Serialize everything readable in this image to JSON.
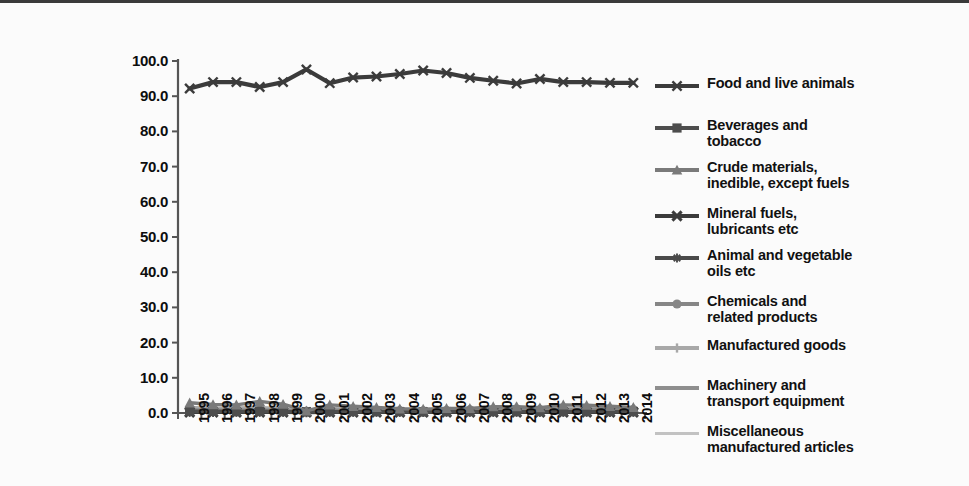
{
  "figure": {
    "background_color": "#fbfbfb",
    "border_top_color": "#3a3a3a"
  },
  "chart_data": {
    "type": "line",
    "title": "",
    "subtitle": "",
    "xlabel": "",
    "ylabel": "",
    "grid": false,
    "legend_position": "right",
    "ylim": [
      0.0,
      100.0
    ],
    "ytick_labels": [
      "100.0",
      "90.0",
      "80.0",
      "70.0",
      "60.0",
      "50.0",
      "40.0",
      "30.0",
      "20.0",
      "10.0",
      "0.0"
    ],
    "ytick_values": [
      100.0,
      90.0,
      80.0,
      70.0,
      60.0,
      50.0,
      40.0,
      30.0,
      20.0,
      10.0,
      0.0
    ],
    "categories": [
      "1995",
      "1996",
      "1997",
      "1998",
      "1999",
      "2000",
      "2001",
      "2002",
      "2003",
      "2004",
      "2005",
      "2006",
      "2007",
      "2008",
      "2009",
      "2010",
      "2011",
      "2012",
      "2013",
      "2014"
    ],
    "x": [
      1995,
      1996,
      1997,
      1998,
      1999,
      2000,
      2001,
      2002,
      2003,
      2004,
      2005,
      2006,
      2007,
      2008,
      2009,
      2010,
      2011,
      2012,
      2013,
      2014
    ],
    "series": [
      {
        "name": "Food and live animals",
        "color": "#3b3b3b",
        "marker": "x",
        "values": [
          92.2,
          94.0,
          94.0,
          92.6,
          94.0,
          97.6,
          93.7,
          95.3,
          95.6,
          96.3,
          97.3,
          96.6,
          95.2,
          94.4,
          93.6,
          94.9,
          94.0,
          94.0,
          93.8,
          93.8
        ]
      },
      {
        "name": "Beverages and\ntobacco",
        "color": "#4d4d4d",
        "marker": "square",
        "values": [
          0.5,
          0.5,
          0.4,
          0.5,
          0.4,
          0.3,
          0.4,
          0.4,
          0.4,
          0.4,
          0.3,
          0.4,
          0.4,
          0.4,
          0.4,
          0.4,
          0.4,
          0.4,
          0.4,
          0.4
        ]
      },
      {
        "name": "Crude materials,\ninedible, except fuels",
        "color": "#7a7a7a",
        "marker": "triangle",
        "values": [
          2.9,
          2.4,
          2.3,
          3.3,
          2.5,
          0.6,
          2.3,
          1.9,
          1.6,
          1.2,
          1.1,
          1.3,
          1.3,
          1.8,
          1.8,
          1.5,
          2.3,
          2.2,
          1.9,
          1.6
        ]
      },
      {
        "name": "Mineral fuels,\nlubricants etc",
        "color": "#3b3b3b",
        "marker": "x-thick",
        "values": [
          0.2,
          0.2,
          0.2,
          0.2,
          0.2,
          0.2,
          0.2,
          0.2,
          0.2,
          0.2,
          0.2,
          0.2,
          0.2,
          0.2,
          0.2,
          0.2,
          0.2,
          0.2,
          0.2,
          0.2
        ]
      },
      {
        "name": "Animal and vegetable\noils etc",
        "color": "#4a4a4a",
        "marker": "star",
        "values": [
          0.2,
          0.2,
          0.2,
          0.2,
          0.2,
          0.1,
          0.2,
          0.2,
          0.2,
          0.2,
          0.2,
          0.2,
          0.2,
          0.2,
          0.2,
          0.2,
          0.2,
          0.2,
          0.2,
          0.2
        ]
      },
      {
        "name": "Chemicals and\nrelated products",
        "color": "#868686",
        "marker": "circle",
        "values": [
          0.9,
          0.8,
          0.8,
          0.8,
          0.8,
          0.5,
          0.8,
          0.7,
          0.7,
          0.7,
          0.6,
          0.7,
          0.9,
          1.0,
          1.2,
          1.0,
          0.9,
          0.9,
          1.0,
          1.0
        ]
      },
      {
        "name": "Manufactured goods",
        "color": "#a8a8a8",
        "marker": "plus",
        "values": [
          1.6,
          1.3,
          1.4,
          1.5,
          1.3,
          0.5,
          1.3,
          1.0,
          1.0,
          0.8,
          0.5,
          0.6,
          1.0,
          1.1,
          1.6,
          1.2,
          1.2,
          1.2,
          1.2,
          1.2
        ]
      },
      {
        "name": "Machinery and\ntransport equipment",
        "color": "#8e8e8e",
        "marker": "line",
        "values": [
          0.4,
          0.4,
          0.4,
          0.4,
          0.4,
          0.2,
          0.4,
          0.3,
          0.3,
          0.3,
          0.2,
          0.3,
          0.4,
          0.4,
          0.5,
          0.4,
          0.4,
          0.4,
          0.4,
          0.4
        ]
      },
      {
        "name": "Miscellaneous\nmanufactured articles",
        "color": "#c2c2c2",
        "marker": "line-thin",
        "values": [
          0.6,
          0.5,
          0.5,
          0.5,
          0.5,
          0.2,
          0.5,
          0.4,
          0.4,
          0.3,
          0.3,
          0.3,
          0.4,
          0.5,
          0.6,
          0.5,
          0.5,
          0.5,
          0.5,
          0.5
        ]
      }
    ]
  },
  "axis": {
    "line_color": "#555555"
  }
}
